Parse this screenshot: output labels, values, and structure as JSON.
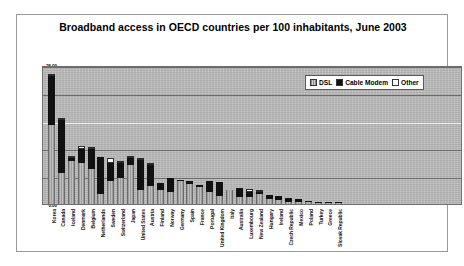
{
  "chart": {
    "title": "Broadband access in OECD countries per 100 inhabitants, June 2003",
    "legend": {
      "dsl": "DSL",
      "cable": "Cable Modem",
      "other": "Other"
    }
  },
  "chart_data": {
    "type": "bar",
    "subtype": "stacked-column",
    "title": "Broadband access in OECD countries per 100 inhabitants, June 2003",
    "xlabel": "",
    "ylabel": "",
    "ylim": [
      0,
      25
    ],
    "ytick_labels": [
      "0.00",
      "5.00",
      "10.00",
      "15.00",
      "20.00",
      "25.00"
    ],
    "yticks": [
      0,
      5,
      10,
      15,
      20,
      25
    ],
    "grid": true,
    "legend_position": "top-right",
    "legend_entries": [
      "DSL",
      "Cable Modem",
      "Other"
    ],
    "colors": {
      "dsl": "#a3a3a3",
      "cable": "#111111",
      "other": "#ffffff",
      "plot_background": "#b9b9b9"
    },
    "categories": [
      "Korea",
      "Canada",
      "Iceland",
      "Denmark",
      "Belgium",
      "Netherlands",
      "Sweden",
      "Switzerland",
      "Japan",
      "United States",
      "Austria",
      "Finland",
      "Norway",
      "Germany",
      "Spain",
      "France",
      "Portugal",
      "United Kingdom",
      "Italy",
      "Australia",
      "Luxembourg",
      "New Zealand",
      "Hungary",
      "Ireland",
      "Czech Republic",
      "Mexico",
      "Poland",
      "Turkey",
      "Greece",
      "Slovak Republic"
    ],
    "series": [
      {
        "name": "DSL",
        "values": [
          14.2,
          5.6,
          7.7,
          7.4,
          6.3,
          1.8,
          4.1,
          4.6,
          7.1,
          2.6,
          3.2,
          2.6,
          2.2,
          4.1,
          3.6,
          3.1,
          2.2,
          1.5,
          2.5,
          1.3,
          1.2,
          1.8,
          0.9,
          0.7,
          0.4,
          0.3,
          0.3,
          0.2,
          0.1,
          0.1
        ]
      },
      {
        "name": "Cable Modem",
        "values": [
          8.9,
          9.5,
          0.5,
          2.5,
          3.6,
          6.7,
          3.2,
          2.8,
          1.2,
          5.3,
          3.8,
          1.1,
          2.4,
          0.1,
          0.5,
          0.4,
          2.0,
          2.4,
          0.0,
          1.6,
          0.9,
          0.3,
          0.7,
          0.8,
          0.7,
          0.6,
          0.2,
          0.1,
          0.1,
          0.1
        ]
      },
      {
        "name": "Other",
        "values": [
          0.2,
          0.3,
          0.5,
          0.5,
          0.1,
          0.0,
          1.0,
          0.1,
          0.1,
          0.3,
          0.1,
          0.0,
          0.0,
          0.0,
          0.0,
          0.0,
          0.0,
          0.0,
          0.0,
          0.0,
          0.6,
          0.5,
          0.0,
          0.0,
          0.0,
          0.0,
          0.0,
          0.0,
          0.0,
          0.0
        ]
      }
    ],
    "totals": [
      23.3,
      15.4,
      8.7,
      10.4,
      10.0,
      8.5,
      8.3,
      7.5,
      8.4,
      8.2,
      7.1,
      3.7,
      4.6,
      4.2,
      4.1,
      3.5,
      4.2,
      3.9,
      2.5,
      2.9,
      2.7,
      2.6,
      1.6,
      1.5,
      1.1,
      0.9,
      0.5,
      0.3,
      0.2,
      0.2
    ]
  }
}
